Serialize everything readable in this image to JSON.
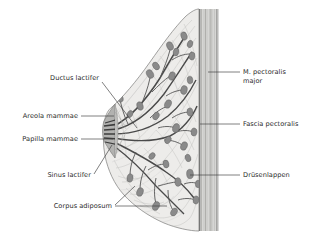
{
  "figure": {
    "background_color": "#ffffff",
    "dimensions": {
      "width": 318,
      "height": 239
    }
  },
  "colors": {
    "background": "#ffffff",
    "label_text": "#2b2b2b",
    "leader_line": "#3a3a3a",
    "outline": "#6f6f6f",
    "adipose_fill": "#ededeb",
    "adipose_stroke": "#9a9a9a",
    "stroma_line": "#b9b9b7",
    "lobule_fill": "#8a8a8a",
    "lobule_stroke": "#5c5c5c",
    "duct_stroke": "#4a4a4a",
    "nipple_fill": "#a9a9a7",
    "areola_fill": "#bdbdbb",
    "fascia_line": "#5a5a5a",
    "muscle_fill": "#d6d6d4",
    "muscle_stripe": "#b0b0ae"
  },
  "labels": {
    "left": [
      {
        "id": "ductus-lactifer",
        "text": "Ductus lactifer",
        "text_x": 99,
        "text_y": 80,
        "leader": "M 102,82 L 137,128"
      },
      {
        "id": "areola-mammae",
        "text": "Areola mammae",
        "text_x": 78,
        "text_y": 118,
        "leader": "M 81,116 L 114,116"
      },
      {
        "id": "papilla-mammae",
        "text": "Papilla mammae",
        "text_x": 78,
        "text_y": 141,
        "leader": "M 81,139 L 113,139"
      },
      {
        "id": "sinus-lactifer",
        "text": "Sinus lactifer",
        "text_x": 91,
        "text_y": 177,
        "leader": "M 94,174 L 112,145"
      },
      {
        "id": "corpus-adiposum",
        "text": "Corpus adiposum",
        "text_x": 112,
        "text_y": 208,
        "leader": "M 115,205 L 135,186 M 115,206 L 167,206"
      }
    ],
    "right": [
      {
        "id": "m-pectoralis-major",
        "text_lines": [
          "M. pectoralis",
          "major"
        ],
        "text_x": 243,
        "text_y": 74,
        "leader": "M 222,72 L 240,72"
      },
      {
        "id": "fascia-pectoralis",
        "text_lines": [
          "Fascia pectoralis"
        ],
        "text_x": 243,
        "text_y": 125,
        "leader": "M 206,124 L 240,124"
      },
      {
        "id": "druesenlappen",
        "text_lines": [
          "Drüsenlappen"
        ],
        "text_x": 243,
        "text_y": 176,
        "leader": "M 190,175 L 240,175"
      }
    ]
  },
  "anatomy": {
    "structures": [
      "Corpus adiposum (fatty body)",
      "Ductus lactifer (lactiferous duct)",
      "Sinus lactifer (lactiferous sinus)",
      "Papilla mammae (nipple)",
      "Areola mammae (areola)",
      "Drüsenlappen (glandular lobes)",
      "Fascia pectoralis",
      "M. pectoralis major"
    ]
  }
}
